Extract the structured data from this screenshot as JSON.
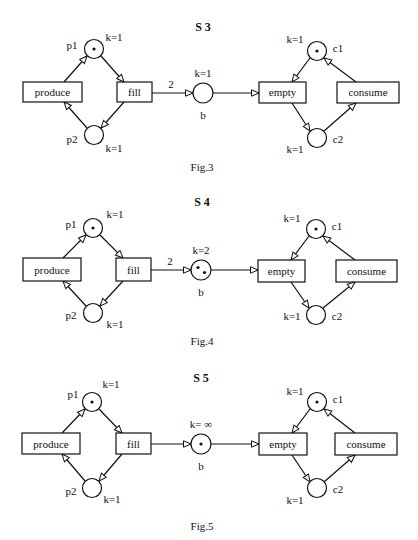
{
  "figures": [
    {
      "title": "S 3",
      "caption": "Fig.3",
      "places": {
        "p1": {
          "label": "p1",
          "capacity": "k=1",
          "tokens": 1
        },
        "p2": {
          "label": "p2",
          "capacity": "k=1",
          "tokens": 0
        },
        "b": {
          "label": "b",
          "capacity": "k=1",
          "tokens": 0
        },
        "c1": {
          "label": "c1",
          "capacity": "k=1",
          "tokens": 1
        },
        "c2": {
          "label": "c2",
          "capacity": "k=1",
          "tokens": 0
        }
      },
      "transitions": {
        "produce": "produce",
        "fill": "fill",
        "empty": "empty",
        "consume": "consume"
      },
      "arc_fill_b_weight": "2"
    },
    {
      "title": "S 4",
      "caption": "Fig.4",
      "places": {
        "p1": {
          "label": "p1",
          "capacity": "k=1",
          "tokens": 1
        },
        "p2": {
          "label": "p2",
          "capacity": "k=1",
          "tokens": 0
        },
        "b": {
          "label": "b",
          "capacity": "k=2",
          "tokens": 2
        },
        "c1": {
          "label": "c1",
          "capacity": "k=1",
          "tokens": 1
        },
        "c2": {
          "label": "c2",
          "capacity": "k=1",
          "tokens": 0
        }
      },
      "transitions": {
        "produce": "produce",
        "fill": "fill",
        "empty": "empty",
        "consume": "consume"
      },
      "arc_fill_b_weight": "2"
    },
    {
      "title": "S 5",
      "caption": "Fig.5",
      "places": {
        "p1": {
          "label": "p1",
          "capacity": "k=1",
          "tokens": 1
        },
        "p2": {
          "label": "p2",
          "capacity": "k=1",
          "tokens": 0
        },
        "b": {
          "label": "b",
          "capacity": "k= ∞",
          "tokens": 1
        },
        "c1": {
          "label": "c1",
          "capacity": "k=1",
          "tokens": 1
        },
        "c2": {
          "label": "c2",
          "capacity": "k=1",
          "tokens": 0
        }
      },
      "transitions": {
        "produce": "produce",
        "fill": "fill",
        "empty": "empty",
        "consume": "consume"
      },
      "arc_fill_b_weight": ""
    }
  ],
  "colors": {
    "ink": "#111111",
    "paper": "#ffffff"
  }
}
